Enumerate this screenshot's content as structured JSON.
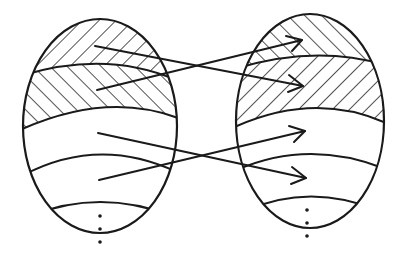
{
  "diagram": {
    "type": "mapping-between-partitioned-sets",
    "colors": {
      "ink": "#1a1a1a",
      "background": "#ffffff"
    },
    "left_set": {
      "shape": "ellipse",
      "center": [
        100,
        126
      ],
      "rx": 77,
      "ry": 107,
      "bands": [
        {
          "index": 1,
          "hatch": "forward-slash"
        },
        {
          "index": 2,
          "hatch": "back-slash"
        },
        {
          "index": 3,
          "hatch": "none"
        },
        {
          "index": 4,
          "hatch": "none"
        },
        {
          "index": 5,
          "hatch": "none",
          "continuation": "vertical-ellipsis"
        }
      ]
    },
    "right_set": {
      "shape": "ellipse",
      "center": [
        310,
        121
      ],
      "rx": 74,
      "ry": 107,
      "bands": [
        {
          "index": 1,
          "hatch": "back-slash"
        },
        {
          "index": 2,
          "hatch": "forward-slash"
        },
        {
          "index": 3,
          "hatch": "none"
        },
        {
          "index": 4,
          "hatch": "none"
        },
        {
          "index": 5,
          "hatch": "none",
          "continuation": "vertical-ellipsis"
        }
      ]
    },
    "arrows": [
      {
        "from_band": "left-1",
        "to_band": "right-2",
        "from": [
          95,
          46
        ],
        "to": [
          303,
          86
        ]
      },
      {
        "from_band": "left-2",
        "to_band": "right-1",
        "from": [
          97,
          90
        ],
        "to": [
          302,
          40
        ]
      },
      {
        "from_band": "left-3",
        "to_band": "right-4",
        "from": [
          98,
          133
        ],
        "to": [
          306,
          178
        ]
      },
      {
        "from_band": "left-4",
        "to_band": "right-3",
        "from": [
          99,
          180
        ],
        "to": [
          305,
          131
        ]
      }
    ],
    "ellipsis_symbol": "⋮"
  }
}
